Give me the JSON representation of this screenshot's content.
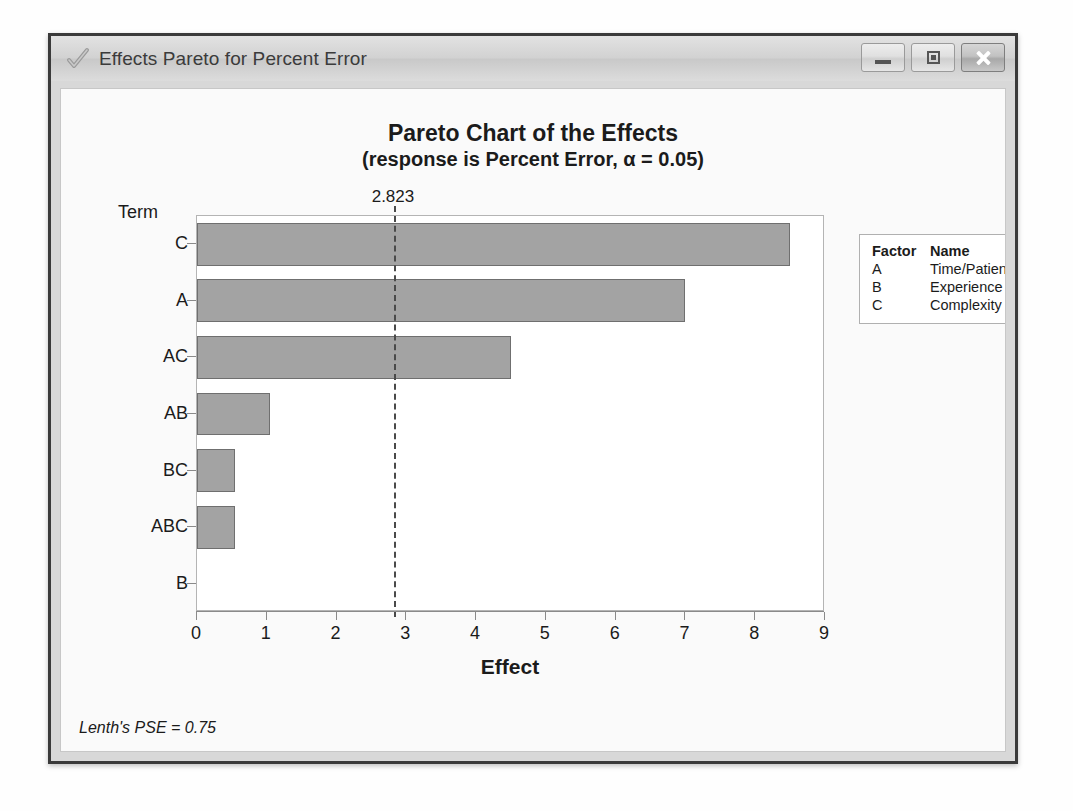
{
  "window": {
    "title": "Effects Pareto for Percent Error",
    "app_icon": "checkmark-icon",
    "buttons": {
      "minimize": "Minimize",
      "maximize": "Maximize",
      "close": "Close"
    }
  },
  "chart_data": {
    "type": "bar",
    "orientation": "horizontal",
    "title": "Pareto Chart of the Effects",
    "subtitle": "(response is Percent Error, α = 0.05)",
    "xlabel": "Effect",
    "ylabel": "Term",
    "categories": [
      "C",
      "A",
      "AC",
      "AB",
      "BC",
      "ABC",
      "B"
    ],
    "values": [
      8.5,
      7.0,
      4.5,
      1.05,
      0.55,
      0.55,
      0.0
    ],
    "xlim": [
      0,
      9
    ],
    "xticks": [
      0,
      1,
      2,
      3,
      4,
      5,
      6,
      7,
      8,
      9
    ],
    "xticklabels": [
      "0",
      "1",
      "2",
      "3",
      "4",
      "5",
      "6",
      "7",
      "8",
      "9"
    ],
    "grid": false,
    "reference_line": {
      "value": 2.823,
      "label": "2.823",
      "style": "dashed"
    },
    "bar_color": "#a3a3a3",
    "bar_edge_color": "#6f6f6f",
    "legend_position": "right",
    "annotation": "Lenth's PSE = 0.75"
  },
  "legend": {
    "header": {
      "factor": "Factor",
      "name": "Name"
    },
    "rows": [
      {
        "factor": "A",
        "name": "Time/Patient"
      },
      {
        "factor": "B",
        "name": "Experience"
      },
      {
        "factor": "C",
        "name": "Complexity"
      }
    ]
  },
  "footer": {
    "pse": "Lenth's PSE = 0.75"
  }
}
